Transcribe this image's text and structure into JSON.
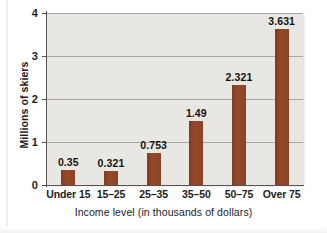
{
  "chart_data": {
    "type": "bar",
    "title": "",
    "xlabel": "Income level (in thousands of dollars)",
    "ylabel": "Millions of skiers",
    "categories": [
      "Under 15",
      "15–25",
      "25–35",
      "35–50",
      "50–75",
      "Over 75"
    ],
    "values": [
      0.35,
      0.321,
      0.753,
      1.49,
      2.321,
      3.631
    ],
    "value_labels": [
      "0.35",
      "0.321",
      "0.753",
      "1.49",
      "2.321",
      "3.631"
    ],
    "ylim": [
      0,
      4
    ],
    "yticks": [
      0,
      1,
      2,
      3,
      4
    ],
    "ytick_labels": [
      "0",
      "1",
      "2",
      "3",
      "4"
    ],
    "grid": true,
    "grid_axis": "y",
    "legend": "none",
    "bar_color": "#8c4426",
    "plot_background": "#e9e7e4",
    "gridline_color": "#a9a6a2",
    "axis_color": "#55524f"
  }
}
